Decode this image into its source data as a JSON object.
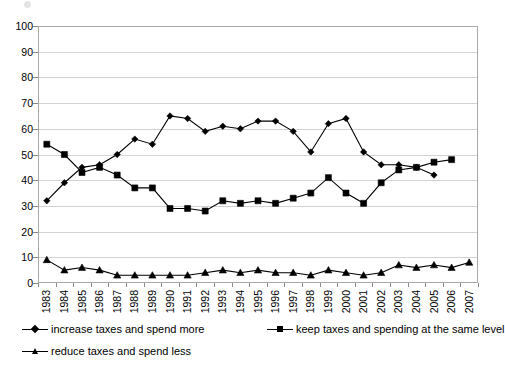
{
  "chart_data": {
    "type": "line",
    "title": "",
    "xlabel": "",
    "ylabel": "",
    "ylim": [
      0,
      100
    ],
    "ytick_step": 10,
    "grid": true,
    "legend_position": "bottom",
    "categories": [
      "1983",
      "1984",
      "1985",
      "1986",
      "1987",
      "1988",
      "1989",
      "1990",
      "1991",
      "1992",
      "1993",
      "1994",
      "1995",
      "1996",
      "1997",
      "1998",
      "1999",
      "2000",
      "2001",
      "2002",
      "2003",
      "2004",
      "2005",
      "2006",
      "2007"
    ],
    "yticks": [
      "0",
      "10",
      "20",
      "30",
      "40",
      "50",
      "60",
      "70",
      "80",
      "90",
      "100"
    ],
    "series": [
      {
        "name": "increase taxes and spend more",
        "marker": "diamond",
        "color": "#000000",
        "values": [
          32,
          39,
          45,
          46,
          50,
          56,
          54,
          65,
          64,
          59,
          61,
          60,
          63,
          63,
          59,
          51,
          62,
          64,
          51,
          46,
          46,
          45,
          42,
          0,
          0
        ]
      },
      {
        "name": "keep taxes and spending at the same level",
        "marker": "square",
        "color": "#000000",
        "values": [
          54,
          50,
          43,
          45,
          42,
          37,
          37,
          29,
          29,
          28,
          32,
          31,
          32,
          31,
          33,
          35,
          41,
          35,
          31,
          39,
          44,
          45,
          47,
          48,
          0
        ]
      },
      {
        "name": "reduce taxes and spend less",
        "marker": "triangle",
        "color": "#000000",
        "values": [
          9,
          5,
          6,
          5,
          3,
          3,
          3,
          3,
          3,
          4,
          5,
          4,
          5,
          4,
          4,
          3,
          5,
          4,
          3,
          4,
          7,
          6,
          7,
          6,
          8
        ]
      }
    ],
    "series_full": {
      "increase_taxes_and_spend_more": [
        32,
        39,
        45,
        46,
        50,
        56,
        54,
        65,
        64,
        59,
        61,
        60,
        63,
        63,
        59,
        51,
        62,
        64,
        51,
        46,
        46,
        45,
        42
      ],
      "keep_taxes_same": [
        54,
        50,
        43,
        45,
        42,
        37,
        37,
        29,
        29,
        28,
        32,
        31,
        32,
        31,
        33,
        35,
        41,
        35,
        31,
        39,
        44,
        45,
        47,
        48
      ],
      "reduce_taxes_and_spend_less": [
        9,
        5,
        6,
        5,
        3,
        3,
        3,
        3,
        3,
        4,
        5,
        4,
        5,
        4,
        4,
        3,
        5,
        4,
        3,
        4,
        7,
        6,
        7,
        6,
        8
      ]
    }
  },
  "legend": {
    "items": [
      {
        "label": "increase taxes and spend more",
        "marker": "diamond-marker-icon"
      },
      {
        "label": "keep taxes and spending at the same level",
        "marker": "square-marker-icon"
      },
      {
        "label": "reduce taxes and spend less",
        "marker": "triangle-marker-icon"
      }
    ]
  }
}
